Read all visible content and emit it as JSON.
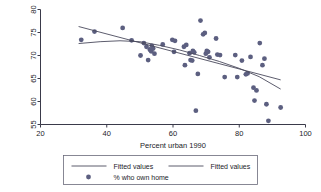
{
  "chart_data": {
    "type": "scatter",
    "title": "",
    "xlabel": "Percent urban 1990",
    "ylabel": "",
    "xlim": [
      20,
      100
    ],
    "ylim": [
      55,
      80
    ],
    "xticks": [
      20,
      40,
      60,
      80,
      100
    ],
    "yticks": [
      55,
      60,
      65,
      70,
      75,
      80
    ],
    "grid": false,
    "legend_position": "below-axis",
    "series": [
      {
        "name": "% who own home",
        "type": "scatter",
        "marker": "circle",
        "color": "#5c5f80",
        "points": [
          [
            32.3,
            73.4
          ],
          [
            36.3,
            75.2
          ],
          [
            44.8,
            76.0
          ],
          [
            47.5,
            73.3
          ],
          [
            50.2,
            70.0
          ],
          [
            51.2,
            72.7
          ],
          [
            52.0,
            71.9
          ],
          [
            52.5,
            69.0
          ],
          [
            53.0,
            71.3
          ],
          [
            53.4,
            70.9
          ],
          [
            53.6,
            72.1
          ],
          [
            54.0,
            71.5
          ],
          [
            54.4,
            70.4
          ],
          [
            56.9,
            72.4
          ],
          [
            59.8,
            73.4
          ],
          [
            60.3,
            70.8
          ],
          [
            60.6,
            73.2
          ],
          [
            63.3,
            71.9
          ],
          [
            63.6,
            67.9
          ],
          [
            64.0,
            72.3
          ],
          [
            65.0,
            70.5
          ],
          [
            65.3,
            69.0
          ],
          [
            65.8,
            68.9
          ],
          [
            66.0,
            71.0
          ],
          [
            66.4,
            70.7
          ],
          [
            66.9,
            58.0
          ],
          [
            67.5,
            66.0
          ],
          [
            68.3,
            77.6
          ],
          [
            69.1,
            74.6
          ],
          [
            69.6,
            74.9
          ],
          [
            69.9,
            70.4
          ],
          [
            70.2,
            71.0
          ],
          [
            70.6,
            70.8
          ],
          [
            71.0,
            69.6
          ],
          [
            73.0,
            73.7
          ],
          [
            73.4,
            70.2
          ],
          [
            74.2,
            70.1
          ],
          [
            75.6,
            65.3
          ],
          [
            78.8,
            70.1
          ],
          [
            79.4,
            65.3
          ],
          [
            80.8,
            68.9
          ],
          [
            82.0,
            65.9
          ],
          [
            82.5,
            66.1
          ],
          [
            83.4,
            69.7
          ],
          [
            84.3,
            63.0
          ],
          [
            84.6,
            60.2
          ],
          [
            85.2,
            62.4
          ],
          [
            86.2,
            72.7
          ],
          [
            87.0,
            67.9
          ],
          [
            87.6,
            69.3
          ],
          [
            88.2,
            59.4
          ],
          [
            88.8,
            55.8
          ],
          [
            92.5,
            58.7
          ]
        ]
      },
      {
        "name": "Fitted values",
        "type": "line",
        "color": "#4a4a5c",
        "points": [
          [
            31.5,
            76.3
          ],
          [
            92.5,
            64.7
          ]
        ]
      },
      {
        "name": "Fitted values",
        "type": "line",
        "color": "#4a4a5c",
        "points": [
          [
            31.5,
            72.6
          ],
          [
            38.0,
            73.0
          ],
          [
            44.0,
            73.2
          ],
          [
            50.0,
            73.0
          ],
          [
            56.0,
            72.2
          ],
          [
            62.0,
            71.2
          ],
          [
            68.0,
            70.0
          ],
          [
            74.0,
            68.7
          ],
          [
            80.0,
            67.2
          ],
          [
            86.0,
            65.4
          ],
          [
            92.5,
            62.7
          ]
        ]
      }
    ]
  },
  "legend": {
    "entries": [
      {
        "label": "Fitted values",
        "marker": "line"
      },
      {
        "label": "Fitted values",
        "marker": "line"
      },
      {
        "label": "% who own home",
        "marker": "circle"
      }
    ]
  }
}
